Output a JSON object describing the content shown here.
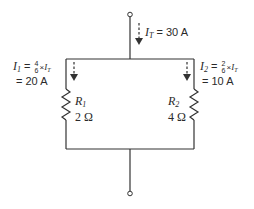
{
  "diagram": {
    "type": "parallel-resistor-circuit",
    "colors": {
      "wire": "#333333",
      "text": "#2a2a2a",
      "background": "#ffffff"
    },
    "total_current": {
      "symbol": "I",
      "subscript": "T",
      "equals": "= 30 A"
    },
    "branch1": {
      "symbol": "I",
      "subscript": "1",
      "frac_num": "4",
      "frac_den": "6",
      "times": "×",
      "ref_symbol": "I",
      "ref_sub": "T",
      "result": "= 20 A",
      "resistor": {
        "name": "R",
        "subscript": "1",
        "value": "2 Ω"
      }
    },
    "branch2": {
      "symbol": "I",
      "subscript": "2",
      "frac_num": "2",
      "frac_den": "6",
      "times": "×",
      "ref_symbol": "I",
      "ref_sub": "T",
      "result": "= 10 A",
      "resistor": {
        "name": "R",
        "subscript": "2",
        "value": "4 Ω"
      }
    }
  }
}
